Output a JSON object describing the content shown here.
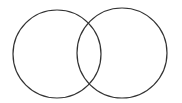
{
  "diagram": {
    "type": "venn",
    "background_color": "#ffffff",
    "stroke_color": "#333333",
    "stroke_width": 1.2,
    "canvas": {
      "width": 182,
      "height": 103
    },
    "circles": [
      {
        "name": "left-circle",
        "cx": 57,
        "cy": 54,
        "r": 44
      },
      {
        "name": "right-circle",
        "cx": 122,
        "cy": 53,
        "r": 45
      }
    ]
  }
}
